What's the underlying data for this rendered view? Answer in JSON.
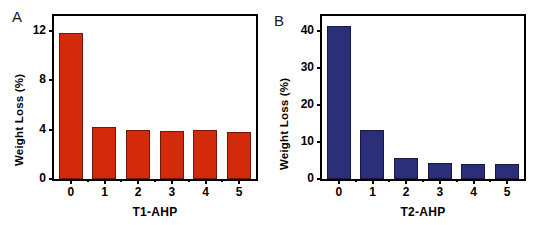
{
  "figure": {
    "panels": [
      {
        "letter": "A",
        "ylabel": "Weight Loss (%)",
        "xlabel": "T1-AHP",
        "color": "#d42a0c"
      },
      {
        "letter": "B",
        "ylabel": "Weight Loss (%)",
        "xlabel": "T2-AHP",
        "color": "#2b2f7a"
      }
    ]
  },
  "chart_data": [
    {
      "type": "bar",
      "title": "A",
      "categories": [
        "0",
        "1",
        "2",
        "3",
        "4",
        "5"
      ],
      "values": [
        11.8,
        4.2,
        4.0,
        3.9,
        3.95,
        3.8
      ],
      "xlabel": "T1-AHP",
      "ylabel": "Weight Loss (%)",
      "ylim": [
        0,
        13.2
      ],
      "yticks": [
        0,
        4,
        8,
        12
      ],
      "ytick_labels": [
        "0",
        "4",
        "8",
        "12"
      ],
      "xtick_labels": [
        "0",
        "1",
        "2",
        "3",
        "4",
        "5"
      ],
      "bar_color": "#d42a0c",
      "grid": false,
      "legend": null
    },
    {
      "type": "bar",
      "title": "B",
      "categories": [
        "0",
        "1",
        "2",
        "3",
        "4",
        "5"
      ],
      "values": [
        41.3,
        13.2,
        5.8,
        4.2,
        4.1,
        4.0
      ],
      "xlabel": "T2-AHP",
      "ylabel": "Weight Loss (%)",
      "ylim": [
        0,
        44.0
      ],
      "yticks": [
        0,
        10,
        20,
        30,
        40
      ],
      "ytick_labels": [
        "0",
        "10",
        "20",
        "30",
        "40"
      ],
      "xtick_labels": [
        "0",
        "1",
        "2",
        "3",
        "4",
        "5"
      ],
      "bar_color": "#2b2f7a",
      "grid": false,
      "legend": null
    }
  ]
}
